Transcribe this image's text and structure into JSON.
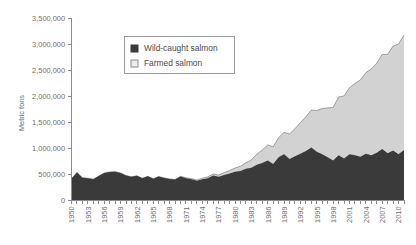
{
  "chart_data": {
    "type": "area",
    "stacked": true,
    "title": "",
    "xlabel": "",
    "ylabel": "Metric tons",
    "ylim": [
      0,
      3500000
    ],
    "ytick_values": [
      0,
      500000,
      1000000,
      1500000,
      2000000,
      2500000,
      3000000,
      3500000
    ],
    "ytick_labels": [
      "0",
      "500,000",
      "1,000,000",
      "1,500,000",
      "2,000,000",
      "2,500,000",
      "3,000,000",
      "3,500,000"
    ],
    "grid": false,
    "legend_position": "upper-left-inside",
    "xtick_label_interval": 3,
    "x": [
      1950,
      1951,
      1952,
      1953,
      1954,
      1955,
      1956,
      1957,
      1958,
      1959,
      1960,
      1961,
      1962,
      1963,
      1964,
      1965,
      1966,
      1967,
      1968,
      1969,
      1970,
      1971,
      1972,
      1973,
      1974,
      1975,
      1976,
      1977,
      1978,
      1979,
      1980,
      1981,
      1982,
      1983,
      1984,
      1985,
      1986,
      1987,
      1988,
      1989,
      1990,
      1991,
      1992,
      1993,
      1994,
      1995,
      1996,
      1997,
      1998,
      1999,
      2000,
      2001,
      2002,
      2003,
      2004,
      2005,
      2006,
      2007,
      2008,
      2009,
      2010,
      2011
    ],
    "xtick_labels": [
      "1950",
      "1953",
      "1956",
      "1959",
      "1962",
      "1965",
      "1968",
      "1971",
      "1974",
      "1977",
      "1980",
      "1983",
      "1986",
      "1989",
      "1992",
      "1995",
      "1998",
      "2001",
      "2004",
      "2007",
      "2010"
    ],
    "series": [
      {
        "name": "Wild-caught salmon",
        "color": "#3a3a3a",
        "values": [
          410000,
          530000,
          430000,
          420000,
          400000,
          460000,
          520000,
          540000,
          545000,
          520000,
          470000,
          445000,
          465000,
          420000,
          455000,
          410000,
          450000,
          425000,
          405000,
          395000,
          450000,
          420000,
          400000,
          370000,
          400000,
          420000,
          470000,
          445000,
          480000,
          510000,
          545000,
          560000,
          600000,
          620000,
          680000,
          710000,
          760000,
          690000,
          820000,
          880000,
          790000,
          840000,
          890000,
          940000,
          1010000,
          930000,
          880000,
          820000,
          760000,
          860000,
          800000,
          880000,
          860000,
          830000,
          890000,
          860000,
          910000,
          980000,
          900000,
          950000,
          880000,
          960000
        ]
      },
      {
        "name": "Farmed salmon",
        "color": "#d2d2d2",
        "values": [
          0,
          0,
          0,
          0,
          0,
          0,
          0,
          0,
          0,
          0,
          0,
          0,
          0,
          0,
          0,
          0,
          0,
          0,
          0,
          0,
          5000,
          8000,
          12000,
          15000,
          20000,
          25000,
          30000,
          35000,
          45000,
          55000,
          70000,
          90000,
          115000,
          150000,
          200000,
          250000,
          300000,
          330000,
          380000,
          420000,
          480000,
          530000,
          600000,
          660000,
          720000,
          790000,
          880000,
          950000,
          1020000,
          1120000,
          1200000,
          1280000,
          1380000,
          1480000,
          1560000,
          1660000,
          1720000,
          1820000,
          1900000,
          2010000,
          2120000,
          2210000
        ]
      }
    ]
  },
  "legend": {
    "items": [
      {
        "label": "Wild-caught salmon",
        "swatch": "#3a3a3a",
        "swatch_border": "#3a3a3a"
      },
      {
        "label": "Farmed salmon",
        "swatch": "#ededed",
        "swatch_border": "#8c8c8c"
      }
    ]
  },
  "colors": {
    "axis": "#8c8c8c",
    "tick_text": "#6e6e6e",
    "legend_text": "#4a4a4a",
    "background": "#ffffff",
    "wild": "#3a3a3a",
    "farmed": "#d2d2d2",
    "farmed_line": "#8c8c8c"
  }
}
